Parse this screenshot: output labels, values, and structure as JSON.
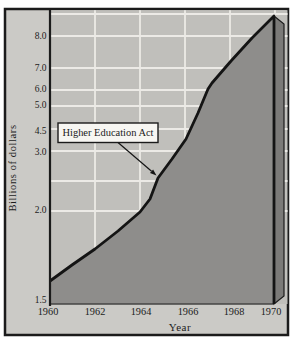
{
  "colors": {
    "frame_border": "#1b1b1b",
    "margin_bg": "#cbcac6",
    "plot_bg": "#c0bfbb",
    "gridline": "#eceae6",
    "area_fill": "#8e8d8b",
    "side_fill": "#7b7a78",
    "line": "#141414",
    "baseline_edge": "#454543",
    "annotation_bg": "#f7f6f2",
    "text": "#1c1c1c"
  },
  "chart_data": {
    "type": "area",
    "title": "",
    "xlabel": "Year",
    "ylabel": "Billions of dollars",
    "x": [
      1960,
      1961,
      1962,
      1963,
      1964,
      1965,
      1966,
      1967,
      1968,
      1969,
      1970
    ],
    "values": [
      1.6,
      1.7,
      1.8,
      1.9,
      2.0,
      2.6,
      3.6,
      5.9,
      7.2,
      7.9,
      8.6
    ],
    "series_note": "Single filled area series; values estimated from distorted axis",
    "y_scale_note": "Y-axis tick spacing is irregular (distorted) exactly as printed",
    "grid": "on, white gridlines on gray background",
    "legend": "none",
    "annotation": {
      "text": "Higher Education Act",
      "points_to_year": 1965
    },
    "y_axis": {
      "ticks": [
        {
          "label": "8.0",
          "value": 8.0,
          "py": 36
        },
        {
          "label": "7.0",
          "value": 7.0,
          "py": 68
        },
        {
          "label": "6.0",
          "value": 6.0,
          "py": 89
        },
        {
          "label": "5.0",
          "value": 5.0,
          "py": 105
        },
        {
          "label": "4.5",
          "value": 4.5,
          "py": 131
        },
        {
          "label": "3.0",
          "value": 3.0,
          "py": 152
        },
        {
          "label": "2.0",
          "value": 2.0,
          "py": 210
        },
        {
          "label": "1.5",
          "value": 1.5,
          "py": 300
        }
      ]
    },
    "x_axis": {
      "ticks": [
        {
          "label": "1960",
          "value": 1960,
          "px": 48
        },
        {
          "label": "1962",
          "value": 1962,
          "px": 95
        },
        {
          "label": "1964",
          "value": 1964,
          "px": 141
        },
        {
          "label": "1966",
          "value": 1966,
          "px": 188
        },
        {
          "label": "1968",
          "value": 1968,
          "px": 234
        },
        {
          "label": "1970",
          "value": 1970,
          "px": 271
        }
      ]
    },
    "pixel_layout": {
      "canvas": {
        "w": 294,
        "h": 349
      },
      "frame": {
        "x": 5,
        "y": 9,
        "w": 283,
        "h": 326
      },
      "plot": {
        "x": 51,
        "y": 10.2,
        "w": 236.5,
        "h": 293.8
      },
      "gridline_ys": [
        14,
        36,
        68,
        90,
        106,
        129,
        151,
        181,
        211
      ],
      "gridline_xs": [
        95,
        140,
        185,
        230,
        275
      ],
      "y_axis_line": {
        "x": 50,
        "y1": 10,
        "y2": 306
      },
      "baseline_y": 304,
      "curve": [
        [
          50,
          281
        ],
        [
          72,
          265
        ],
        [
          95,
          249
        ],
        [
          118,
          231
        ],
        [
          140,
          212
        ],
        [
          150,
          199
        ],
        [
          158,
          178
        ],
        [
          172,
          159
        ],
        [
          186,
          139
        ],
        [
          198,
          113
        ],
        [
          208,
          89
        ],
        [
          212,
          83
        ],
        [
          231,
          61
        ],
        [
          252,
          38
        ],
        [
          265,
          25
        ],
        [
          274,
          16
        ]
      ],
      "area_close": [
        [
          274,
          304
        ],
        [
          50,
          304
        ]
      ],
      "side_panel": [
        [
          274,
          16
        ],
        [
          284,
          24
        ],
        [
          284,
          296
        ],
        [
          274,
          304
        ]
      ],
      "y_label_right_x": 46.5,
      "x_label_y": 314.5,
      "x_title_pos": {
        "x": 180,
        "y": 331
      },
      "y_title_pos": {
        "x": 16,
        "y": 168
      },
      "annotation_box": {
        "x": 58,
        "y": 123,
        "w": 100,
        "h": 19.5
      },
      "annotation_text_pos": {
        "x": 108,
        "y": 136.3
      },
      "arrow": {
        "x1": 118,
        "y1": 142.5,
        "x2": 156.5,
        "y2": 175.5
      }
    }
  }
}
